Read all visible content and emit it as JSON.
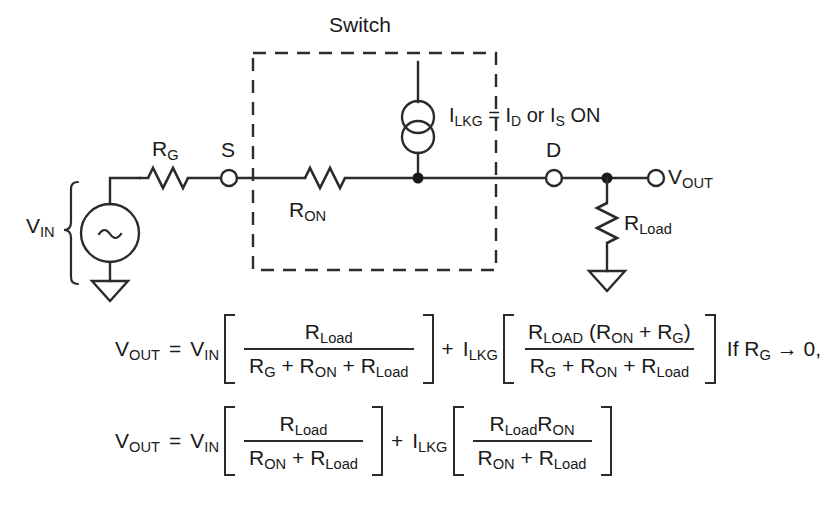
{
  "figure": {
    "background": "#ffffff",
    "ink_color": "#2b2b2b"
  },
  "circuit": {
    "switch_box_label": "Switch",
    "source": {
      "label_main": "V",
      "label_sub": "IN",
      "symbol": "ac-source",
      "waveform_glyph": "~"
    },
    "series_resistor": {
      "label_main": "R",
      "label_sub": "G"
    },
    "terminal_s": "S",
    "terminal_d": "D",
    "on_resistor": {
      "label_main": "R",
      "label_sub": "ON"
    },
    "leakage_source": {
      "label": "I_LKG = I_D or I_S ON",
      "parts": {
        "i": "I",
        "lkg": "LKG",
        "equals": "=",
        "i_d_main": "I",
        "i_d_sub": "D",
        "or": "or",
        "i_s_main": "I",
        "i_s_sub": "S",
        "on": "ON"
      }
    },
    "load_resistor": {
      "label_main": "R",
      "label_sub": "Load"
    },
    "output": {
      "label_main": "V",
      "label_sub": "OUT"
    },
    "ground_symbol": "triangle"
  },
  "equations": {
    "eq1": {
      "lhs_main": "V",
      "lhs_sub": "OUT",
      "equals": "=",
      "v_main": "V",
      "v_sub": "IN",
      "frac1": {
        "num_main": "R",
        "num_sub": "Load",
        "den": "R_G + R_ON + R_Load",
        "den_parts": [
          {
            "main": "R",
            "sub": "G"
          },
          {
            "main": "R",
            "sub": "ON"
          },
          {
            "main": "R",
            "sub": "Load"
          }
        ]
      },
      "plus": "+",
      "i_main": "I",
      "i_sub": "LKG",
      "frac2": {
        "num": "R_LOAD (R_ON + R_G)",
        "num_parts": [
          {
            "main": "R",
            "sub": "LOAD"
          },
          {
            "main": "R",
            "sub": "ON"
          },
          {
            "main": "R",
            "sub": "G"
          }
        ],
        "den": "R_G + R_ON + R_Load",
        "den_parts": [
          {
            "main": "R",
            "sub": "G"
          },
          {
            "main": "R",
            "sub": "ON"
          },
          {
            "main": "R",
            "sub": "Load"
          }
        ]
      },
      "condition": "If R_G → 0,",
      "condition_parts": {
        "if": "If",
        "r_main": "R",
        "r_sub": "G",
        "arrow": "→",
        "value": "0,"
      }
    },
    "eq2": {
      "lhs_main": "V",
      "lhs_sub": "OUT",
      "equals": "=",
      "v_main": "V",
      "v_sub": "IN",
      "frac1": {
        "num_main": "R",
        "num_sub": "Load",
        "den": "R_ON + R_Load",
        "den_parts": [
          {
            "main": "R",
            "sub": "ON"
          },
          {
            "main": "R",
            "sub": "Load"
          }
        ]
      },
      "plus": "+",
      "i_main": "I",
      "i_sub": "LKG",
      "frac2": {
        "num": "R_Load R_ON",
        "num_parts": [
          {
            "main": "R",
            "sub": "Load"
          },
          {
            "main": "R",
            "sub": "ON"
          }
        ],
        "den": "R_ON + R_Load",
        "den_parts": [
          {
            "main": "R",
            "sub": "ON"
          },
          {
            "main": "R",
            "sub": "Load"
          }
        ]
      }
    }
  }
}
